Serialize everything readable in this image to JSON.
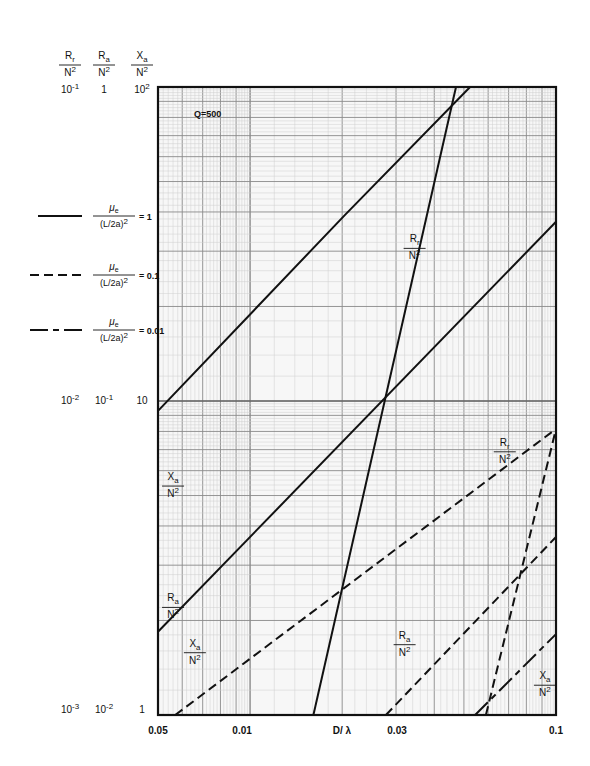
{
  "chart_data": {
    "type": "line",
    "title": "",
    "annotation": "Q=500",
    "xlabel": "D/ λ",
    "x_scale": "log",
    "xlim": [
      0.005,
      0.1
    ],
    "x_tick_labels": [
      "0.05",
      "0.01",
      "D/ λ",
      "0.03",
      "0.1"
    ],
    "x_tick_values": [
      0.005,
      0.01,
      null,
      0.03,
      0.1
    ],
    "y_scale": "log",
    "ylim": [
      1,
      100
    ],
    "y_axes": [
      {
        "quantity": {
          "num": "R",
          "sub": "r",
          "den": "N2"
        },
        "tick_labels": [
          "10-1",
          "10-2",
          "10-3"
        ]
      },
      {
        "quantity": {
          "num": "R",
          "sub": "a",
          "den": "N2"
        },
        "tick_labels": [
          "1",
          "10-1",
          "10-2"
        ]
      },
      {
        "quantity": {
          "num": "X",
          "sub": "a",
          "den": "N2"
        },
        "tick_labels": [
          "102",
          "10",
          "1"
        ]
      }
    ],
    "y_tick_values_xa": [
      100,
      10,
      1
    ],
    "grid": true,
    "legend": {
      "placement": "left",
      "entries": [
        {
          "style": "solid",
          "lhs_num": "μe",
          "lhs_den": "(L/2a)2",
          "value": "= 1"
        },
        {
          "style": "dashed",
          "lhs_num": "μe",
          "lhs_den": "(L/2a)2",
          "value": "= 0.1"
        },
        {
          "style": "dashdot",
          "lhs_num": "μe",
          "lhs_den": "(L/2a)2",
          "value": "= 0.01"
        }
      ]
    },
    "series": [
      {
        "name": "Xa/N2 (μe/(L/2a)2 = 1)",
        "style": "solid",
        "points": [
          [
            0.005,
            9.3
          ],
          [
            0.0204,
            39.1
          ],
          [
            0.0524,
            100
          ]
        ]
      },
      {
        "name": "Rr/N2 (μe/(L/2a)2 = 1)",
        "style": "solid",
        "points": [
          [
            0.0161,
            1
          ],
          [
            0.0471,
            100
          ]
        ]
      },
      {
        "name": "Ra/N2 (μe/(L/2a)2 = 1)",
        "style": "solid",
        "points": [
          [
            0.005,
            1.84
          ],
          [
            0.1,
            37.2
          ]
        ]
      },
      {
        "name": "Xa/N2 (μe/(L/2a)2 = 0.1)",
        "style": "dashed",
        "points": [
          [
            0.00569,
            1
          ],
          [
            0.1,
            8.15
          ]
        ]
      },
      {
        "name": "Rr/N2 (μe/(L/2a)2 = 0.1)",
        "style": "dashed",
        "points": [
          [
            0.059,
            1
          ],
          [
            0.1,
            8.15
          ]
        ]
      },
      {
        "name": "Ra/N2 (μe/(L/2a)2 = 0.1)",
        "style": "dashed",
        "points": [
          [
            0.0278,
            1
          ],
          [
            0.1,
            3.69
          ]
        ]
      },
      {
        "name": "Xa/N2 (μe/(L/2a)2 = 0.01)",
        "style": "dashdot",
        "points": [
          [
            0.0544,
            1
          ],
          [
            0.1,
            1.81
          ]
        ]
      }
    ],
    "curve_labels": [
      {
        "num": "X",
        "sub": "a",
        "den": "N2",
        "series": 0,
        "at": [
          0.0056,
          5.6
        ]
      },
      {
        "num": "R",
        "sub": "r",
        "den": "N2",
        "series": 1,
        "at": [
          0.0345,
          32
        ]
      },
      {
        "num": "R",
        "sub": "a",
        "den": "N2",
        "series": 2,
        "at": [
          0.0056,
          2.3
        ]
      },
      {
        "num": "R",
        "sub": "r",
        "den": "N2",
        "series": 4,
        "at": [
          0.068,
          7.2
        ]
      },
      {
        "num": "X",
        "sub": "a",
        "den": "N2",
        "series": 3,
        "at": [
          0.0066,
          1.65
        ]
      },
      {
        "num": "R",
        "sub": "a",
        "den": "N2",
        "series": 5,
        "at": [
          0.032,
          1.75
        ]
      },
      {
        "num": "X",
        "sub": "a",
        "den": "N2",
        "series": 6,
        "at": [
          0.092,
          1.3
        ]
      }
    ]
  }
}
